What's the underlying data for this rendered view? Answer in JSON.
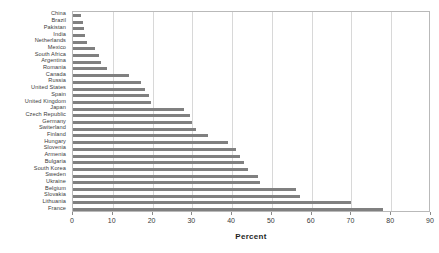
{
  "chart_data": {
    "type": "bar",
    "orientation": "horizontal",
    "title": "",
    "xlabel": "Percent",
    "ylabel": "",
    "xlim": [
      0,
      90
    ],
    "xticks": [
      0,
      10,
      20,
      30,
      40,
      50,
      60,
      70,
      80,
      90
    ],
    "grid": true,
    "legend": false,
    "bar_color": "#808080",
    "frame_color": "#b9b9b9",
    "gridline_color": "#d8d8d8",
    "categories": [
      "China",
      "Brazil",
      "Pakistan",
      "India",
      "Netherlands",
      "Mexico",
      "South Africa",
      "Argentina",
      "Romania",
      "Canada",
      "Russia",
      "United States",
      "Spain",
      "United Kingdom",
      "Japan",
      "Czech Republic",
      "Germany",
      "Switerland",
      "Finland",
      "Hungary",
      "Slovenia",
      "Armenia",
      "Bulgaria",
      "South Korea",
      "Sweden",
      "Ukraine",
      "Belgium",
      "Slovakia",
      "Lithuania",
      "France"
    ],
    "values": [
      2.0,
      2.5,
      2.8,
      3.0,
      3.5,
      5.5,
      6.5,
      7.0,
      8.5,
      14.0,
      17.0,
      18.0,
      19.0,
      19.5,
      28.0,
      29.5,
      30.0,
      31.0,
      34.0,
      39.0,
      41.0,
      42.0,
      43.0,
      44.0,
      46.5,
      47.0,
      56.0,
      57.0,
      70.0,
      78.0
    ]
  }
}
